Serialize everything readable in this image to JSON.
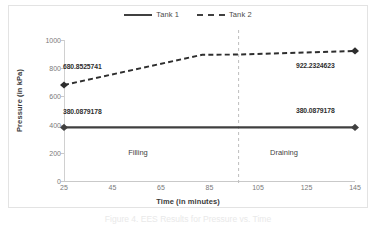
{
  "chart_data": {
    "type": "line",
    "title": "",
    "xlabel": "Time (in minutes)",
    "ylabel": "Pressure (in kPa)",
    "xlim": [
      25,
      145
    ],
    "ylim": [
      0,
      1000
    ],
    "grid": false,
    "legend_position": "top-center",
    "xticks": [
      25,
      45,
      65,
      85,
      105,
      125,
      145
    ],
    "yticks": [
      0,
      200,
      400,
      600,
      800,
      1000
    ],
    "series": [
      {
        "name": "Tank 1",
        "style": "solid",
        "color": "#404040",
        "marker": "diamond",
        "x": [
          25,
          145
        ],
        "values": [
          380.0879178,
          380.0879178
        ]
      },
      {
        "name": "Tank 2",
        "style": "dashed",
        "color": "#2e2e2e",
        "marker": "diamond",
        "x": [
          25,
          82,
          97,
          145
        ],
        "values": [
          680.8525741,
          895,
          897,
          922.2324623
        ]
      }
    ],
    "data_labels": [
      {
        "text": "680.8525741",
        "series": "Tank 2",
        "x": 25,
        "y": 680.8525741
      },
      {
        "text": "922.2324623",
        "series": "Tank 2",
        "x": 145,
        "y": 922.2324623
      },
      {
        "text": "380.0879178",
        "series": "Tank 1",
        "x": 25,
        "y": 380.0879178
      },
      {
        "text": "380.0879178",
        "series": "Tank 1",
        "x": 145,
        "y": 380.0879178
      }
    ],
    "annotations": [
      {
        "type": "vline",
        "name": "phase-divider",
        "x": 97,
        "style": "dashed",
        "color": "#b4b4b4"
      },
      {
        "type": "text",
        "name": "phase-filling",
        "label": "Filling",
        "x": 62,
        "y": 215
      },
      {
        "type": "text",
        "name": "phase-draining",
        "label": "Draining",
        "x": 122,
        "y": 215
      }
    ]
  },
  "legend": {
    "entries": [
      {
        "label": "Tank 1",
        "style": "solid"
      },
      {
        "label": "Tank 2",
        "style": "dashed"
      }
    ]
  },
  "axes": {
    "y_title": "Pressure (in kPa)",
    "x_title": "Time (in minutes)",
    "y_tick_labels": [
      "1000",
      "800",
      "600",
      "400",
      "200",
      "0"
    ],
    "x_tick_labels": [
      "25",
      "45",
      "65",
      "85",
      "105",
      "125",
      "145"
    ]
  },
  "labels": {
    "tank2_left": "680.8525741",
    "tank2_right": "922.2324623",
    "tank1_left": "380.0879178",
    "tank1_right": "380.0879178",
    "phase_filling": "Filling",
    "phase_draining": "Draining"
  },
  "caption": {
    "text": "Figure 4. EES Results for Pressure vs. Time"
  }
}
